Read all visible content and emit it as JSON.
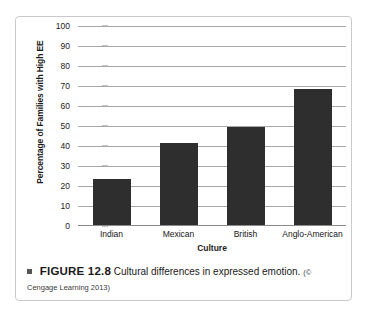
{
  "figure": {
    "caption_bullet": "square-bullet",
    "label": "FIGURE 12.8",
    "text": "Cultural differences in expressed emotion.",
    "credit": "(© Cengage Learning 2013)"
  },
  "chart_data": {
    "type": "bar",
    "title": "",
    "categories": [
      "Indian",
      "Mexican",
      "British",
      "Anglo-American"
    ],
    "values": [
      23,
      41,
      49,
      68
    ],
    "xlabel": "Culture",
    "ylabel": "Percentage of Families with High EE",
    "ylim": [
      0,
      100
    ],
    "yticks": [
      0,
      10,
      20,
      30,
      40,
      50,
      60,
      70,
      80,
      90,
      100
    ],
    "ytick_labels": [
      "0",
      "10",
      "20",
      "30",
      "40",
      "50",
      "60",
      "70",
      "80",
      "90",
      "100"
    ],
    "grid": true,
    "grid_axis": "y",
    "legend": false,
    "bar_color": "#2e2e2e",
    "gridline_color": "#a8a8a8",
    "axis_color": "#8a8a8a"
  }
}
